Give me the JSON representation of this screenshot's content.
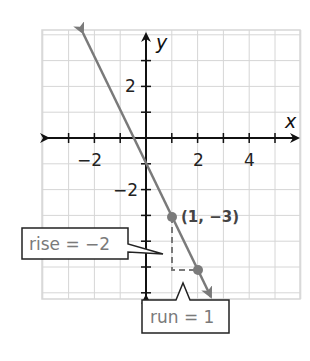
{
  "chart_data": {
    "type": "line",
    "title": "",
    "xlabel": "x",
    "ylabel": "y",
    "xlim": [
      -4,
      6
    ],
    "ylim": [
      -6,
      4
    ],
    "grid": true,
    "x_tick_labels": [
      {
        "value": -2,
        "label": "−2"
      },
      {
        "value": 2,
        "label": "2"
      },
      {
        "value": 4,
        "label": "4"
      }
    ],
    "y_tick_labels": [
      {
        "value": 2,
        "label": "2"
      },
      {
        "value": -2,
        "label": "−2"
      }
    ],
    "series": [
      {
        "name": "y = -2x - 1",
        "slope": -2,
        "intercept": -1,
        "x_range": [
          -2.42,
          2.5
        ],
        "arrows": "both",
        "color": "#7a7a7a"
      }
    ],
    "points": [
      {
        "x": 1,
        "y": -3,
        "label": "(1, −3)"
      },
      {
        "x": 2,
        "y": -5,
        "label": ""
      }
    ],
    "slope_triangle": {
      "from": {
        "x": 1,
        "y": -3
      },
      "corner": {
        "x": 1,
        "y": -5
      },
      "to": {
        "x": 2,
        "y": -5
      },
      "style": "dashed"
    },
    "annotations": [
      {
        "id": "rise",
        "text": "rise = −2",
        "points_to": {
          "x": 0.65,
          "y": -4.5
        }
      },
      {
        "id": "run",
        "text": "run = 1",
        "points_to": {
          "x": 1.45,
          "y": -5.6
        }
      }
    ]
  },
  "colors": {
    "grid": "#d6d6d6",
    "axes": "#111111",
    "line": "#7a7a7a",
    "point": "#7a7a7a",
    "callout_border": "#222222",
    "callout_text": "#7a7a7a",
    "point_label": "#444444"
  },
  "labels": {
    "x_axis": "x",
    "y_axis": "y",
    "point_label": "(1, −3)",
    "rise": "rise = −2",
    "run": "run = 1",
    "x_tick_neg2": "−2",
    "x_tick_2": "2",
    "x_tick_4": "4",
    "y_tick_2": "2",
    "y_tick_neg2": "−2"
  }
}
